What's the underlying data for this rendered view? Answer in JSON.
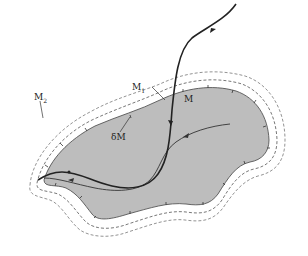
{
  "figure": {
    "labels": {
      "M": "M",
      "M1": "M",
      "M1_sub": "1",
      "M2": "M",
      "M2_sub": "2",
      "boundary": "δM"
    },
    "colors": {
      "region_fill": "#bdbdbd",
      "region_stroke": "#555555",
      "dashed": "#666666",
      "trajectory": "#222222",
      "background": "#ffffff"
    },
    "elements": [
      "region-M (shaded)",
      "boundary-deltaM (with inward normal ticks)",
      "level-set-M1 (dashed)",
      "level-set-M2 (dashed)",
      "trajectory-thick (exits region)",
      "trajectory-thin (inside region)"
    ]
  }
}
